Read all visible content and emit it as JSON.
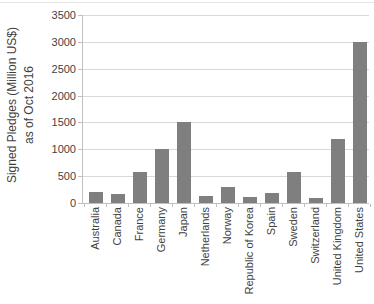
{
  "chart_data": {
    "type": "bar",
    "title": "",
    "categories": [
      "Australia",
      "Canada",
      "France",
      "Germany",
      "Japan",
      "Netherlands",
      "Norway",
      "Republic of Korea",
      "Spain",
      "Sweden",
      "Switzerland",
      "United Kingdom",
      "United States"
    ],
    "values": [
      200,
      165,
      580,
      1000,
      1500,
      135,
      300,
      110,
      180,
      580,
      100,
      1200,
      3000
    ],
    "ylabel_line1": "Signed Pledges (Million US$)",
    "ylabel_line2": "as of Oct 2016",
    "xlabel": "",
    "ylim": [
      0,
      3500
    ],
    "yticks": [
      0,
      500,
      1000,
      1500,
      2000,
      2500,
      3000,
      3500
    ],
    "grid": "horizontal",
    "legend": "none",
    "bar_color": "#7f7f7f",
    "gridline_color": "#d9d9d9",
    "axis_color": "#bfbfbf",
    "text_color": "#3f3f3f"
  }
}
